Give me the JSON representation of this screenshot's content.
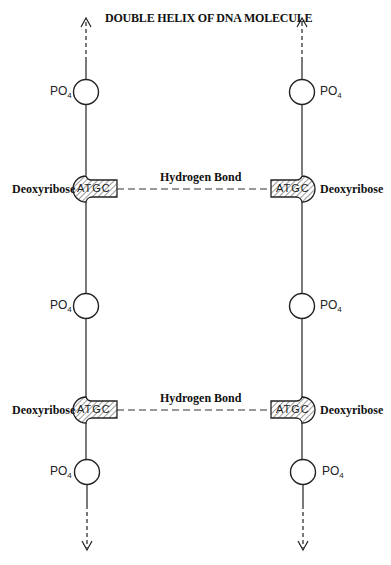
{
  "title": "DOUBLE HELIX OF DNA MOLECULE",
  "labels": {
    "phosphate": "PO",
    "phosphate_sub": "4",
    "sugar": "Deoxyribose",
    "bond": "Hydrogen Bond",
    "bases": "ATGC"
  },
  "strands": [
    {
      "side": "left",
      "x": 86
    },
    {
      "side": "right",
      "x": 302
    }
  ],
  "rows": [
    {
      "type": "phosphate",
      "y": 90
    },
    {
      "type": "sugar",
      "y": 189,
      "bond_label": "Hydrogen Bond"
    },
    {
      "type": "phosphate",
      "y": 306
    },
    {
      "type": "sugar",
      "y": 410,
      "bond_label": "Hydrogen Bond"
    },
    {
      "type": "phosphate",
      "y": 472
    }
  ]
}
